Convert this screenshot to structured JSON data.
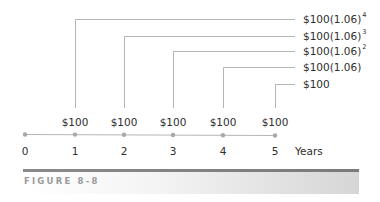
{
  "diagram": {
    "type": "timeline",
    "future_values": [
      {
        "base": "$100(1.06)",
        "exponent": "4"
      },
      {
        "base": "$100(1.06)",
        "exponent": "3"
      },
      {
        "base": "$100(1.06)",
        "exponent": "2"
      },
      {
        "base": "$100(1.06)",
        "exponent": ""
      },
      {
        "base": "$100",
        "exponent": ""
      }
    ],
    "payments": [
      "$100",
      "$100",
      "$100",
      "$100",
      "$100"
    ],
    "years": [
      "0",
      "1",
      "2",
      "3",
      "4",
      "5"
    ],
    "axis_label": "Years",
    "line_color": "#b0b0b0",
    "dot_color": "#a8a8a8"
  },
  "figure": {
    "caption": "FIGURE 8-8"
  }
}
